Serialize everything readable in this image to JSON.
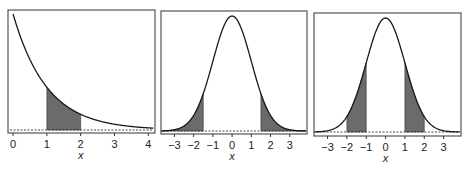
{
  "chart_data": [
    {
      "type": "area",
      "title": "",
      "distribution": "exponential",
      "xlabel": "x",
      "ylabel": "",
      "xlim": [
        -0.15,
        4.2
      ],
      "xticks": [
        0,
        1,
        2,
        3,
        4
      ],
      "xtick_labels": [
        "0",
        "1",
        "2",
        "3",
        "4"
      ],
      "shaded_regions": [
        [
          1,
          2
        ]
      ],
      "curve": "exp(-x)",
      "baseline": "dashed"
    },
    {
      "type": "area",
      "title": "",
      "distribution": "standard normal",
      "xlabel": "x",
      "ylabel": "",
      "xlim": [
        -3.7,
        3.9
      ],
      "xticks": [
        -3,
        -2,
        -1,
        0,
        1,
        2,
        3
      ],
      "xtick_labels": [
        "−3",
        "−2",
        "−1",
        "0",
        "1",
        "2",
        "3"
      ],
      "shaded_regions": [
        [
          -4,
          -1.5
        ],
        [
          1.5,
          4
        ]
      ],
      "curve": "N(0,1) density",
      "baseline": "dashed"
    },
    {
      "type": "area",
      "title": "",
      "distribution": "standard normal",
      "xlabel": "x",
      "ylabel": "",
      "xlim": [
        -3.7,
        3.9
      ],
      "xticks": [
        -3,
        -2,
        -1,
        0,
        1,
        2,
        3
      ],
      "xtick_labels": [
        "−3",
        "−2",
        "−1",
        "0",
        "1",
        "2",
        "3"
      ],
      "shaded_regions": [
        [
          -2,
          -1
        ],
        [
          1,
          2
        ]
      ],
      "curve": "N(0,1) density",
      "baseline": "dashed"
    }
  ],
  "panels": [
    {
      "xlabel": "x",
      "ticks": [
        "0",
        "1",
        "2",
        "3",
        "4"
      ]
    },
    {
      "xlabel": "x",
      "ticks": [
        "−3",
        "−2",
        "−1",
        "0",
        "1",
        "2",
        "3"
      ]
    },
    {
      "xlabel": "x",
      "ticks": [
        "−3",
        "−2",
        "−1",
        "0",
        "1",
        "2",
        "3"
      ]
    }
  ],
  "colors": {
    "shade": "#6b6b6b",
    "curve": "#1a1a1a",
    "frame": "#555555"
  }
}
